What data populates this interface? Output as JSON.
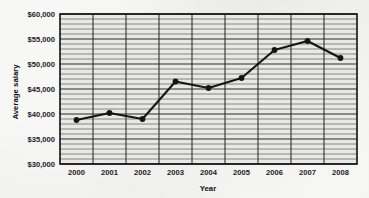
{
  "chart_data": {
    "type": "line",
    "title": "",
    "xlabel": "Year",
    "ylabel": "Average salary",
    "categories": [
      "2000",
      "2001",
      "2002",
      "2003",
      "2004",
      "2005",
      "2006",
      "2007",
      "2008"
    ],
    "x": [
      2000,
      2001,
      2002,
      2003,
      2004,
      2005,
      2006,
      2007,
      2008
    ],
    "values": [
      38800,
      40200,
      39000,
      46500,
      45200,
      47200,
      52800,
      54600,
      51200
    ],
    "series": [
      {
        "name": "Average salary",
        "values": [
          38800,
          40200,
          39000,
          46500,
          45200,
          47200,
          52800,
          54600,
          51200
        ]
      }
    ],
    "ylim": [
      30000,
      60000
    ],
    "ytick_values": [
      30000,
      35000,
      40000,
      45000,
      50000,
      55000,
      60000
    ],
    "ytick_labels": [
      "$30,000",
      "$35,000",
      "$40,000",
      "$45,000",
      "$50,000",
      "$55,000",
      "$60,000"
    ],
    "y_minor_step": 1000,
    "grid": "major-and-minor-horizontal-plus-vertical-at-categories",
    "legend": "none",
    "marker": "filled-circle",
    "line_color": "#141414",
    "marker_color": "#141414",
    "grid_color": "#6b6b6b",
    "axis_color": "#111111",
    "plot_background": "#e8e8e6"
  },
  "axes": {
    "x_axis_title": "Year",
    "y_axis_title": "Average salary"
  }
}
